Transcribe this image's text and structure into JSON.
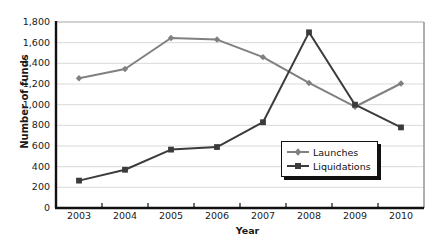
{
  "chart_data": {
    "type": "line",
    "title": "",
    "xlabel": "Year",
    "ylabel": "Number of funds",
    "categories": [
      "2003",
      "2004",
      "2005",
      "2006",
      "2007",
      "2008",
      "2009",
      "2010"
    ],
    "x": [
      2003,
      2004,
      2005,
      2006,
      2007,
      2008,
      2009,
      2010
    ],
    "series": [
      {
        "name": "Launches",
        "color": "#808080",
        "marker": "diamond",
        "values": [
          1255,
          1345,
          1645,
          1630,
          1460,
          1210,
          980,
          1205
        ]
      },
      {
        "name": "Liquidations",
        "color": "#3b3b3b",
        "marker": "square",
        "values": [
          265,
          370,
          565,
          590,
          830,
          1700,
          1000,
          780
        ]
      }
    ],
    "ylim": [
      0,
      1800
    ],
    "ytick_step": 200,
    "ytick_labels": [
      "0",
      "200",
      "400",
      "600",
      "800",
      "1,000",
      "1,200",
      "1,400",
      "1,600",
      "1,800"
    ],
    "ytick_values": [
      0,
      200,
      400,
      600,
      800,
      1000,
      1200,
      1400,
      1600,
      1800
    ],
    "grid": "horizontal",
    "legend_position": "inside-bottom-right",
    "legend_entries": [
      "Launches",
      "Liquidations"
    ]
  },
  "colors": {
    "launches": "#808080",
    "liquidations": "#3b3b3b",
    "axis": "#111111",
    "grid": "#d9d9d9",
    "text": "#1a1a1a",
    "background": "#ffffff"
  }
}
